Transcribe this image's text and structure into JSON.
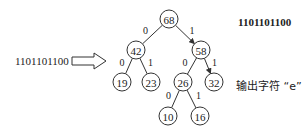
{
  "header_code": "1101101100",
  "input": {
    "code": "1101101100",
    "arrow": "hollow-right-arrow"
  },
  "output_label": "输出字符 “e”",
  "tree": {
    "nodes": [
      {
        "id": "n68",
        "value": "68",
        "x": 169,
        "y": 19
      },
      {
        "id": "n42",
        "value": "42",
        "x": 136,
        "y": 50
      },
      {
        "id": "n58",
        "value": "58",
        "x": 201,
        "y": 50
      },
      {
        "id": "n19",
        "value": "19",
        "x": 122,
        "y": 82
      },
      {
        "id": "n23",
        "value": "23",
        "x": 151,
        "y": 82
      },
      {
        "id": "n26",
        "value": "26",
        "x": 183,
        "y": 82
      },
      {
        "id": "n32",
        "value": "32",
        "x": 214,
        "y": 82
      },
      {
        "id": "n10",
        "value": "10",
        "x": 168,
        "y": 116
      },
      {
        "id": "n16",
        "value": "16",
        "x": 200,
        "y": 116
      }
    ],
    "edges": [
      {
        "from": "n68",
        "to": "n42",
        "label": "0",
        "arrow": false
      },
      {
        "from": "n68",
        "to": "n58",
        "label": "1",
        "arrow": true
      },
      {
        "from": "n42",
        "to": "n19",
        "label": "0",
        "arrow": false
      },
      {
        "from": "n42",
        "to": "n23",
        "label": "1",
        "arrow": false
      },
      {
        "from": "n58",
        "to": "n26",
        "label": "0",
        "arrow": false
      },
      {
        "from": "n58",
        "to": "n32",
        "label": "1",
        "arrow": true
      },
      {
        "from": "n26",
        "to": "n10",
        "label": "0",
        "arrow": false
      },
      {
        "from": "n26",
        "to": "n16",
        "label": "1",
        "arrow": false
      }
    ]
  }
}
